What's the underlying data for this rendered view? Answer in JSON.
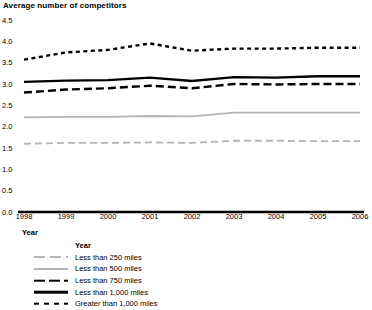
{
  "chart_data": {
    "type": "line",
    "title": "Average number of competitors",
    "ylabel": "Average number of competitors",
    "xlabel": "Year",
    "categories": [
      "1998",
      "1999",
      "2000",
      "2001",
      "2002",
      "2003",
      "2004",
      "2005",
      "2006"
    ],
    "ylim": [
      0.0,
      4.5
    ],
    "ytick_labels": [
      "0.0",
      "0.5",
      "1.0",
      "1.5",
      "2.0",
      "2.5",
      "3.0",
      "3.5",
      "4.0",
      "4.5"
    ],
    "ytick_values": [
      0.0,
      0.5,
      1.0,
      1.5,
      2.0,
      2.5,
      3.0,
      3.5,
      4.0,
      4.5
    ],
    "grid": false,
    "legend_position": "below-left",
    "legend_title": "Year",
    "series": [
      {
        "name": "Less than 250 miles",
        "style": "gray-dashed",
        "color": "#b4b4b4",
        "values": [
          1.6,
          1.62,
          1.62,
          1.63,
          1.62,
          1.67,
          1.67,
          1.66,
          1.66
        ]
      },
      {
        "name": "Less than 500 miles",
        "style": "gray-solid",
        "color": "#b4b4b4",
        "values": [
          2.22,
          2.23,
          2.23,
          2.25,
          2.24,
          2.33,
          2.33,
          2.33,
          2.33
        ]
      },
      {
        "name": "Less than 750 miles",
        "style": "black-dashed",
        "color": "#000000",
        "values": [
          2.8,
          2.87,
          2.9,
          2.96,
          2.9,
          3.0,
          2.99,
          3.0,
          3.0
        ]
      },
      {
        "name": "Less than 1,000 miles",
        "style": "black-solid",
        "color": "#000000",
        "values": [
          3.05,
          3.08,
          3.09,
          3.15,
          3.07,
          3.16,
          3.15,
          3.18,
          3.18
        ]
      },
      {
        "name": "Greater than 1,000 miles",
        "style": "black-dotted",
        "color": "#000000",
        "values": [
          3.57,
          3.74,
          3.8,
          3.95,
          3.78,
          3.83,
          3.83,
          3.85,
          3.85
        ]
      }
    ]
  }
}
